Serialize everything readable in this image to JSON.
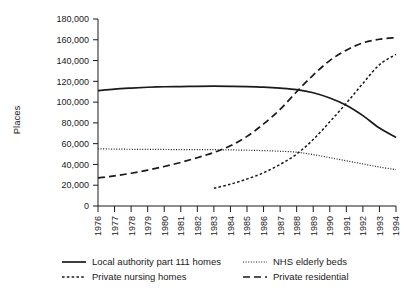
{
  "chart_data": {
    "type": "line",
    "title": "",
    "xlabel": "",
    "ylabel": "Places",
    "xlim": [
      1976,
      1994
    ],
    "ylim": [
      0,
      180000
    ],
    "grid": false,
    "legend_position": "bottom",
    "x": [
      1976,
      1977,
      1978,
      1979,
      1980,
      1981,
      1982,
      1983,
      1984,
      1985,
      1986,
      1987,
      1988,
      1989,
      1990,
      1991,
      1992,
      1993,
      1994
    ],
    "xtick_labels": [
      "1976",
      "1977",
      "1978",
      "1979",
      "1980",
      "1981",
      "1982",
      "1983",
      "1984",
      "1985",
      "1986",
      "1987",
      "1988",
      "1989",
      "1990",
      "1991",
      "1992",
      "1993",
      "1994"
    ],
    "ytick_labels": [
      "0",
      "20,000",
      "40,000",
      "60,000",
      "80,000",
      "100,000",
      "120,000",
      "140,000",
      "160,000",
      "180,000"
    ],
    "ytick_values": [
      0,
      20000,
      40000,
      60000,
      80000,
      100000,
      120000,
      140000,
      160000,
      180000
    ],
    "series": [
      {
        "name": "Local authority part 111 homes",
        "style": "solid",
        "color": "#1a1a1a",
        "values": [
          111000,
          112500,
          113500,
          114300,
          114800,
          115000,
          115200,
          115300,
          115200,
          115000,
          114500,
          113500,
          112000,
          109000,
          104000,
          97000,
          87000,
          75000,
          66000
        ]
      },
      {
        "name": "Private nursing homes",
        "style": "fine-dotted",
        "color": "#1a1a1a",
        "values": [
          null,
          null,
          null,
          null,
          null,
          null,
          null,
          17000,
          21000,
          26000,
          32000,
          40000,
          50000,
          64000,
          81000,
          99000,
          118000,
          136000,
          146000
        ]
      },
      {
        "name": "NHS elderly beds",
        "style": "dotted",
        "color": "#1a1a1a",
        "values": [
          55000,
          54800,
          54600,
          54500,
          54400,
          54300,
          54300,
          54200,
          54000,
          53700,
          53300,
          52700,
          51800,
          49500,
          46500,
          43500,
          40500,
          37500,
          35000
        ]
      },
      {
        "name": "Private residential",
        "style": "dashed",
        "color": "#1a1a1a",
        "values": [
          27000,
          29000,
          31500,
          34500,
          38000,
          42000,
          46500,
          51500,
          58000,
          67000,
          79000,
          93000,
          110000,
          126000,
          140000,
          150000,
          157000,
          160500,
          162000
        ]
      }
    ]
  },
  "legend": {
    "entries": [
      {
        "label": "Local authority part 111 homes",
        "style": "solid"
      },
      {
        "label": "Private nursing homes",
        "style": "fine-dotted"
      },
      {
        "label": "NHS elderly beds",
        "style": "dotted"
      },
      {
        "label": "Private residential",
        "style": "dashed"
      }
    ]
  }
}
